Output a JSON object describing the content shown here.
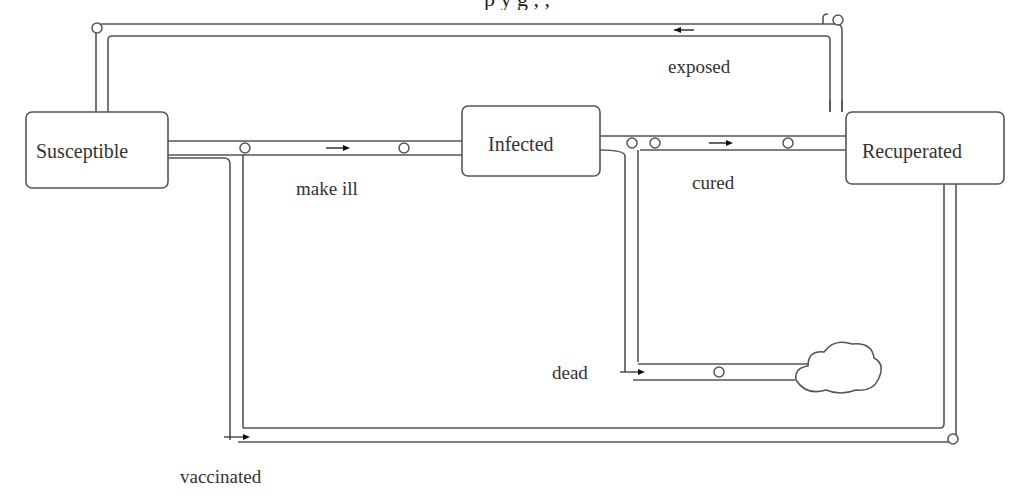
{
  "caption": {
    "text": "p                 y       g                         ,     ,"
  },
  "nodes": {
    "susceptible": {
      "label": "Susceptible"
    },
    "infected": {
      "label": "Infected"
    },
    "recuperated": {
      "label": "Recuperated"
    },
    "sink": {
      "label": "cloud"
    }
  },
  "flows": {
    "make_ill": {
      "label": "make ill",
      "from": "Susceptible",
      "to": "Infected"
    },
    "cured": {
      "label": "cured",
      "from": "Infected",
      "to": "Recuperated"
    },
    "exposed": {
      "label": "exposed",
      "from": "Recuperated",
      "to": "Susceptible"
    },
    "dead": {
      "label": "dead",
      "from": "Infected",
      "to": "cloud"
    },
    "vaccinated": {
      "label": "vaccinated",
      "from": "Susceptible",
      "to": "Recuperated"
    }
  },
  "colors": {
    "stroke": "#555555",
    "background": "#ffffff",
    "text": "#333333"
  }
}
